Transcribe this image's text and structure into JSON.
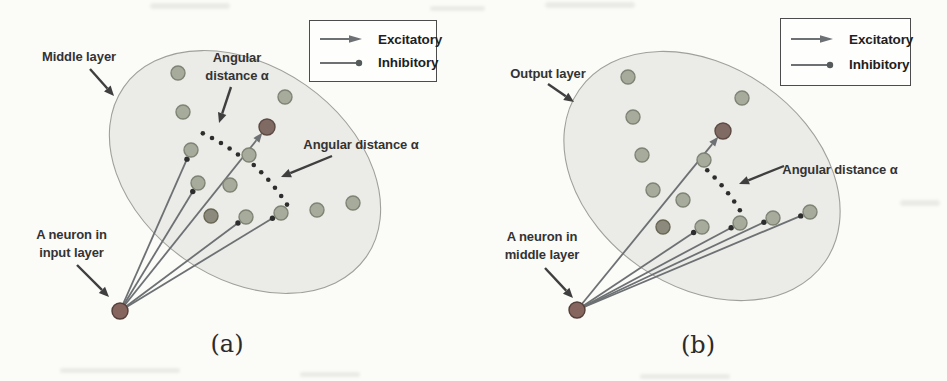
{
  "colors": {
    "page_bg": "#fbfbf8",
    "ellipse_fill": "#ebebe7",
    "ellipse_stroke": "#a0a09b",
    "neuron_fill": "#a6ab9c",
    "neuron_stroke": "#7e8474",
    "target_neuron_fill": "#806b64",
    "target_neuron_stroke": "#5d4a43",
    "shaded_neuron_fill": "#8c8a7c",
    "shaded_neuron_stroke": "#696654",
    "source_neuron_fill": "#86655e",
    "source_neuron_stroke": "#553f39",
    "connection_line": "#6d7173",
    "dot": "#2d2d2d",
    "pointer": "#3f3f3f",
    "legend_border": "#4c4c4c",
    "label_text": "#333333"
  },
  "panels": [
    {
      "caption": "(a)",
      "layer_label": "Middle layer",
      "source_label_line1": "A neuron in",
      "source_label_line2": "input layer",
      "angular_top_line1": "Angular",
      "angular_top_line2": "distance α",
      "angular_right_label": "Angular distance α",
      "legend": {
        "excitatory_label": "Excitatory",
        "inhibitory_label": "Inhibitory"
      },
      "geometry": {
        "ellipse": {
          "cx": 245,
          "cy": 172,
          "rx": 148,
          "ry": 106,
          "rotate": 35
        },
        "source": {
          "x": 120,
          "y": 311,
          "r": 8
        },
        "neurons": [
          {
            "x": 178,
            "y": 73,
            "type": "normal"
          },
          {
            "x": 285,
            "y": 97,
            "type": "normal"
          },
          {
            "x": 183,
            "y": 112,
            "type": "normal"
          },
          {
            "x": 267,
            "y": 127,
            "type": "target"
          },
          {
            "x": 191,
            "y": 150,
            "type": "normal"
          },
          {
            "x": 249,
            "y": 155,
            "type": "normal"
          },
          {
            "x": 198,
            "y": 183,
            "type": "normal"
          },
          {
            "x": 230,
            "y": 185,
            "type": "normal"
          },
          {
            "x": 211,
            "y": 216,
            "type": "shaded"
          },
          {
            "x": 246,
            "y": 217,
            "type": "normal"
          },
          {
            "x": 281,
            "y": 213,
            "type": "normal"
          },
          {
            "x": 317,
            "y": 210,
            "type": "normal"
          },
          {
            "x": 353,
            "y": 203,
            "type": "normal"
          }
        ],
        "connections": [
          {
            "to": 3,
            "kind": "excitatory"
          },
          {
            "to": 4,
            "kind": "inhibitory"
          },
          {
            "to": 6,
            "kind": "inhibitory"
          },
          {
            "to": 9,
            "kind": "inhibitory"
          },
          {
            "to": 10,
            "kind": "inhibitory"
          }
        ],
        "arcs": [
          {
            "r": 196,
            "a1": -65,
            "a2": -53,
            "dots": 5
          },
          {
            "r": 198,
            "a1": -47.5,
            "a2": -32.5,
            "dots": 6
          }
        ],
        "pointers": [
          {
            "x1": 90,
            "y1": 69,
            "x2": 114,
            "y2": 96
          },
          {
            "x1": 231,
            "y1": 87,
            "x2": 219,
            "y2": 123
          },
          {
            "x1": 332,
            "y1": 156,
            "x2": 281,
            "y2": 177
          },
          {
            "x1": 77,
            "y1": 265,
            "x2": 109,
            "y2": 297
          }
        ]
      }
    },
    {
      "caption": "(b)",
      "layer_label": "Output layer",
      "source_label_line1": "A neuron in",
      "source_label_line2": "middle layer",
      "angular_right_label": "Angular distance α",
      "legend": {
        "excitatory_label": "Excitatory",
        "inhibitory_label": "Inhibitory"
      },
      "geometry": {
        "ellipse": {
          "cx": 702,
          "cy": 176,
          "rx": 150,
          "ry": 110,
          "rotate": 35
        },
        "source": {
          "x": 577,
          "y": 310,
          "r": 8
        },
        "neurons": [
          {
            "x": 628,
            "y": 77,
            "type": "normal"
          },
          {
            "x": 742,
            "y": 98,
            "type": "normal"
          },
          {
            "x": 633,
            "y": 117,
            "type": "normal"
          },
          {
            "x": 723,
            "y": 131,
            "type": "target"
          },
          {
            "x": 642,
            "y": 155,
            "type": "normal"
          },
          {
            "x": 704,
            "y": 160,
            "type": "normal"
          },
          {
            "x": 653,
            "y": 190,
            "type": "normal"
          },
          {
            "x": 683,
            "y": 200,
            "type": "normal"
          },
          {
            "x": 663,
            "y": 227,
            "type": "shaded"
          },
          {
            "x": 702,
            "y": 227,
            "type": "normal"
          },
          {
            "x": 740,
            "y": 223,
            "type": "normal"
          },
          {
            "x": 773,
            "y": 218,
            "type": "normal"
          },
          {
            "x": 810,
            "y": 212,
            "type": "normal"
          }
        ],
        "connections": [
          {
            "to": 3,
            "kind": "excitatory"
          },
          {
            "to": 9,
            "kind": "inhibitory"
          },
          {
            "to": 10,
            "kind": "inhibitory"
          },
          {
            "to": 11,
            "kind": "inhibitory"
          },
          {
            "to": 12,
            "kind": "inhibitory"
          }
        ],
        "arcs": [
          {
            "r": 191,
            "a1": -47,
            "a2": -31.5,
            "dots": 6
          }
        ],
        "pointers": [
          {
            "x1": 548,
            "y1": 84,
            "x2": 574,
            "y2": 102
          },
          {
            "x1": 784,
            "y1": 166,
            "x2": 739,
            "y2": 184
          },
          {
            "x1": 545,
            "y1": 268,
            "x2": 573,
            "y2": 298
          }
        ]
      }
    }
  ]
}
